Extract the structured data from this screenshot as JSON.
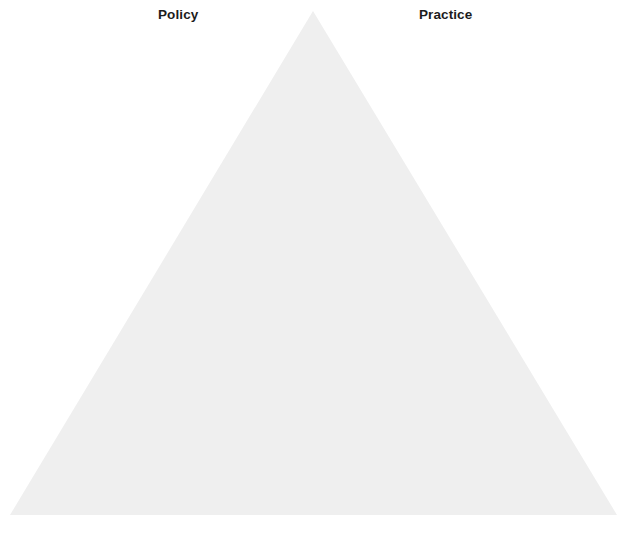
{
  "diagram": {
    "type": "triangle-framework",
    "background_color": "#ffffff",
    "triangle": {
      "name": "policy-practice-triangle",
      "fill_color": "#efefef",
      "stroke_color": "none",
      "apex": {
        "x": 313,
        "y": 11
      },
      "bottom_left": {
        "x": 10,
        "y": 515
      },
      "bottom_right": {
        "x": 617,
        "y": 515
      }
    },
    "labels": [
      {
        "id": "policy",
        "text": "Policy",
        "position": "top-left",
        "color": "#1c1c1c",
        "weight": "bold"
      },
      {
        "id": "practice",
        "text": "Practice",
        "position": "top-right",
        "color": "#1c1c1c",
        "weight": "bold"
      }
    ]
  }
}
